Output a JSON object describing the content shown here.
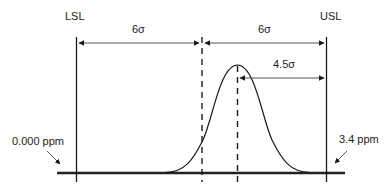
{
  "diagram": {
    "labels": {
      "lsl": "LSL",
      "usl": "USL",
      "left_span": "6σ",
      "right_span": "6σ",
      "shift_span": "4.5σ",
      "left_tail": "0.000 ppm",
      "right_tail": "3.4 ppm"
    },
    "colors": {
      "line": "#1a1a1a",
      "arrow": "#555555",
      "baseline": "#222222",
      "background": "#ffffff"
    }
  }
}
